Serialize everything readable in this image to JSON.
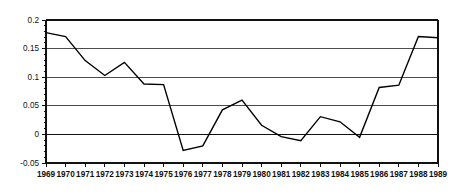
{
  "chart_data": {
    "type": "line",
    "title": "",
    "subtitle": "",
    "xlabel": "",
    "ylabel": "",
    "categories": [
      "1969",
      "1970",
      "1971",
      "1972",
      "1973",
      "1974",
      "1975",
      "1976",
      "1977",
      "1978",
      "1979",
      "1980",
      "1981",
      "1982",
      "1983",
      "1984",
      "1985",
      "1986",
      "1987",
      "1988",
      "1989"
    ],
    "values": [
      0.178,
      0.171,
      0.129,
      0.103,
      0.126,
      0.088,
      0.087,
      -0.028,
      -0.02,
      0.043,
      0.06,
      0.016,
      -0.004,
      -0.011,
      0.031,
      0.022,
      -0.005,
      0.082,
      0.086,
      0.171,
      0.169
    ],
    "series": [
      {
        "name": "series-1",
        "values": [
          0.178,
          0.171,
          0.129,
          0.103,
          0.126,
          0.088,
          0.087,
          -0.028,
          -0.02,
          0.043,
          0.06,
          0.016,
          -0.004,
          -0.011,
          0.031,
          0.022,
          -0.005,
          0.082,
          0.086,
          0.171,
          0.169
        ]
      }
    ],
    "x": [
      "1969",
      "1970",
      "1971",
      "1972",
      "1973",
      "1974",
      "1975",
      "1976",
      "1977",
      "1978",
      "1979",
      "1980",
      "1981",
      "1982",
      "1983",
      "1984",
      "1985",
      "1986",
      "1987",
      "1988",
      "1989"
    ],
    "ylim": [
      -0.05,
      0.2
    ],
    "xlim": [
      "1969",
      "1989"
    ],
    "ytick_labels": [
      "0.2",
      "0.15",
      "0.1",
      "0.05",
      "0",
      "-0.05"
    ],
    "ytick_values": [
      0.2,
      0.15,
      0.1,
      0.05,
      0,
      -0.05
    ],
    "xtick_labels": [
      "1969",
      "1970",
      "1971",
      "1972",
      "1973",
      "1974",
      "1975",
      "1976",
      "1977",
      "1978",
      "1979",
      "1980",
      "1981",
      "1982",
      "1983",
      "1984",
      "1985",
      "1986",
      "1987",
      "1988",
      "1989"
    ],
    "grid": true,
    "grid_axis": "y",
    "legend": false,
    "legend_position": "none",
    "annotations": [],
    "colors": {
      "line": "#000000",
      "grid": "#4d4d4d",
      "zero_line": "#111111",
      "axis": "#111111",
      "background": "#ffffff",
      "text": "#111111"
    }
  }
}
